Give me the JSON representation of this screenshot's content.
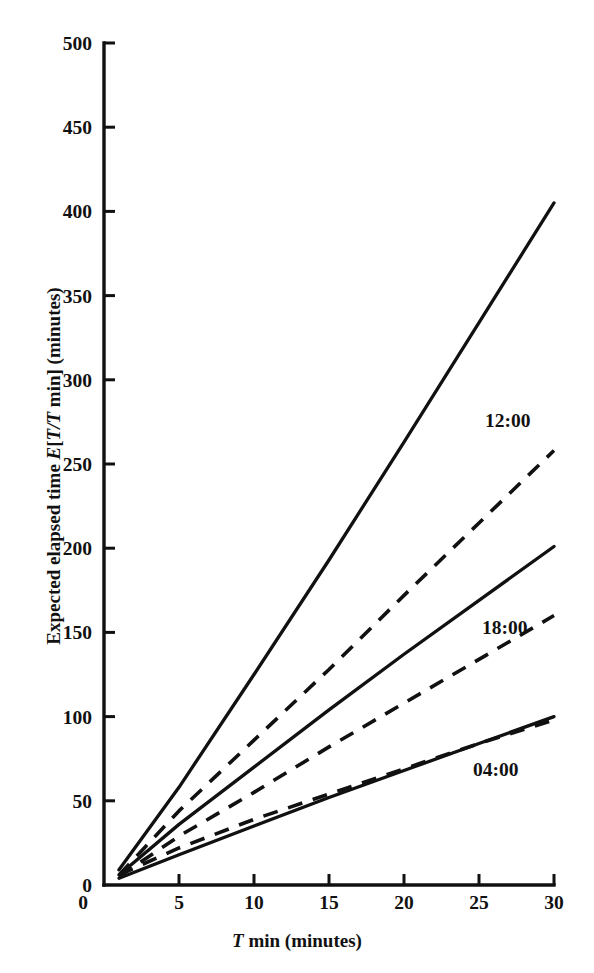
{
  "chart_data": {
    "type": "line",
    "title": "",
    "xlabel_parts": {
      "symbol": "T",
      "rest": " min (minutes)"
    },
    "ylabel_parts": {
      "lead": "Expected elapsed time ",
      "symbol_e": "E",
      "bracket_open": "[",
      "symbol_t1": "T",
      "slash": "/",
      "symbol_t2": "T",
      "rest": " min] (minutes)"
    },
    "xlabel": "T min (minutes)",
    "ylabel": "Expected elapsed time E[T/T min] (minutes)",
    "xlim": [
      0,
      30
    ],
    "ylim": [
      0,
      500
    ],
    "xticks": [
      0,
      5,
      10,
      15,
      20,
      25,
      30
    ],
    "xtick_labels": [
      "0",
      "5",
      "10",
      "15",
      "20",
      "25",
      "30"
    ],
    "yticks": [
      0,
      50,
      100,
      150,
      200,
      250,
      300,
      350,
      400,
      450,
      500
    ],
    "ytick_labels": [
      "0",
      "50",
      "100",
      "150",
      "200",
      "250",
      "300",
      "350",
      "400",
      "450",
      "500"
    ],
    "grid": false,
    "legend": "inline-annotations",
    "x": [
      1,
      5,
      10,
      15,
      20,
      25,
      30
    ],
    "series": [
      {
        "name": "12:00 solid",
        "group": "12:00",
        "style": "solid",
        "values": [
          9,
          58,
          125,
          193,
          263,
          334,
          405
        ]
      },
      {
        "name": "12:00 dashed",
        "group": "12:00",
        "style": "dashed",
        "values": [
          6,
          44,
          86,
          128,
          172,
          215,
          258
        ]
      },
      {
        "name": "18:00 solid",
        "group": "18:00",
        "style": "solid",
        "values": [
          6,
          36,
          70,
          104,
          137,
          169,
          201
        ]
      },
      {
        "name": "18:00 dashed",
        "group": "18:00",
        "style": "dashed",
        "values": [
          5,
          29,
          55,
          82,
          108,
          134,
          160
        ]
      },
      {
        "name": "04:00 solid",
        "group": "04:00",
        "style": "solid",
        "values": [
          4,
          18,
          35,
          52,
          68,
          84,
          100
        ]
      },
      {
        "name": "04:00 dashed",
        "group": "04:00",
        "style": "dashed",
        "values": [
          6,
          22,
          39,
          54,
          69,
          84,
          98
        ]
      }
    ],
    "annotations": [
      {
        "label": "12:00",
        "x": 25.4,
        "y": 276
      },
      {
        "label": "18:00",
        "x": 25.2,
        "y": 153
      },
      {
        "label": "04:00",
        "x": 24.6,
        "y": 69
      }
    ],
    "colors": {
      "line": "#111111",
      "background": "#ffffff"
    }
  }
}
